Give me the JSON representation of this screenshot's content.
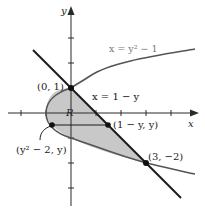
{
  "diagram": {
    "axes": {
      "x_label": "x",
      "y_label": "y",
      "unit_px": 25,
      "origin_px": [
        71,
        113
      ],
      "x_ticks": [
        -2,
        -1,
        1,
        2,
        3,
        4
      ],
      "y_ticks": [
        3,
        2,
        1,
        -1,
        -2,
        -3
      ]
    },
    "curves": {
      "parabola": {
        "equation": "x = y² − 1",
        "label": "x = y² − 1"
      },
      "line": {
        "equation": "x = 1 − y",
        "label": "x = 1 − y"
      }
    },
    "region": {
      "label": "R",
      "fill": "#c8c8c8"
    },
    "points": {
      "top_intersection": {
        "label": "(0, 1)",
        "x": 0,
        "y": 1
      },
      "bottom_intersection": {
        "label": "(3, −2)",
        "x": 3,
        "y": -2
      },
      "left_sample": {
        "label": "(y² − 2, y)"
      },
      "right_sample": {
        "label": "(1 − y, y)"
      }
    },
    "colors": {
      "axis": "#2a2a2a",
      "parabola": "#555555",
      "line": "#1a1a1a",
      "shading": "#c8c8c8"
    }
  }
}
